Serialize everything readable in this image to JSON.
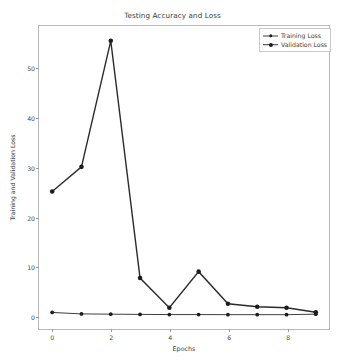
{
  "chart_data": {
    "type": "line",
    "title": "Testing Accuracy and Loss",
    "xlabel": "Epochs",
    "ylabel": "Training and Validation Loss",
    "x": [
      0,
      1,
      2,
      3,
      4,
      5,
      6,
      7,
      8,
      9
    ],
    "xlim": [
      -0.45,
      9.45
    ],
    "ylim": [
      -2.8,
      58.5
    ],
    "xticks": [
      0,
      2,
      4,
      6,
      8
    ],
    "xtick_labels": [
      "0",
      "2",
      "4",
      "6",
      "8"
    ],
    "yticks": [
      0,
      10,
      20,
      30,
      40,
      50
    ],
    "ytick_labels": [
      "0",
      "10",
      "20",
      "30",
      "40",
      "50"
    ],
    "grid": false,
    "legend_position": "upper right",
    "series": [
      {
        "name": "Training Loss",
        "color": "#3d3d3d",
        "marker": "circle",
        "linewidth": 1.0,
        "values": [
          0.55,
          0.25,
          0.2,
          0.15,
          0.12,
          0.12,
          0.1,
          0.1,
          0.1,
          0.2
        ]
      },
      {
        "name": "Validation Loss",
        "color": "#2b2b2b",
        "marker": "circle",
        "linewidth": 1.4,
        "values": [
          25.0,
          30.0,
          55.5,
          7.5,
          1.5,
          8.8,
          2.3,
          1.7,
          1.5,
          0.6
        ]
      }
    ]
  },
  "legend": {
    "entries": [
      {
        "label": "Training Loss"
      },
      {
        "label": "Validation Loss"
      }
    ]
  }
}
